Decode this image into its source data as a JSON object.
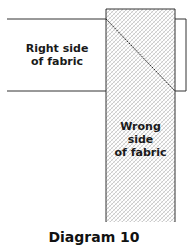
{
  "diagram": {
    "right_side_label": [
      "Right side",
      "of fabric"
    ],
    "wrong_side_label": [
      "Wrong",
      "side",
      "of fabric"
    ],
    "caption": "Diagram 10"
  },
  "colors": {
    "stroke": "#333333",
    "hatch": "#9a9a9a",
    "background": "#ffffff"
  }
}
